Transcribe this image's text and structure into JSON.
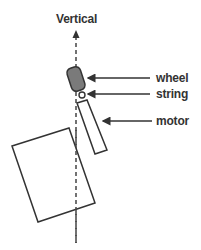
{
  "diagram": {
    "title": "Vertical",
    "labels": {
      "wheel": "wheel",
      "string": "string",
      "motor": "motor"
    },
    "colors": {
      "stroke": "#333333",
      "wheel_fill": "#7a7a7a",
      "background": "#ffffff"
    }
  }
}
